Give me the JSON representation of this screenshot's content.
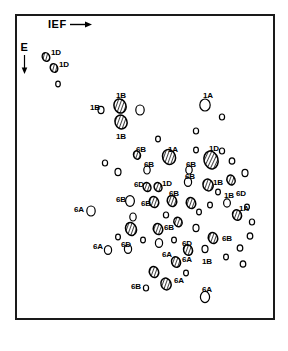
{
  "figure": {
    "background_color": "#ffffff",
    "ink_color": "#000000",
    "frame": {
      "x": 15,
      "y": 14,
      "width": 260,
      "height": 306,
      "border_color": "#1a1a1a",
      "border_width": 2
    }
  },
  "axes": {
    "horizontal": {
      "label": "IEF",
      "arrow": "right-arrow-icon",
      "direction": "right"
    },
    "vertical": {
      "label": "E",
      "arrow": "down-arrow-icon",
      "direction": "down"
    }
  },
  "legend": {
    "filled_style": "hatched",
    "open_style": "outline",
    "note": "Hatched ellipses denote labelled protein spots; open ellipses denote unlabelled spots."
  },
  "chart_data": {
    "type": "scatter",
    "xlabel": "IEF",
    "ylabel": "E",
    "xlim": [
      15,
      275
    ],
    "ylim": [
      14,
      320
    ],
    "grid": false,
    "legend_position": "none",
    "x_direction": "right",
    "y_direction": "down",
    "point_count": 84,
    "labels_present": [
      "1A",
      "1B",
      "1D",
      "6A",
      "6B",
      "6D"
    ],
    "points": [
      {
        "x": 46,
        "y": 57,
        "rx": 3.6,
        "ry": 4.4,
        "rot": -25,
        "fill": "hatched",
        "label": "1D",
        "lx": 51,
        "ly": 49
      },
      {
        "x": 54,
        "y": 68,
        "rx": 3.6,
        "ry": 4.4,
        "rot": -25,
        "fill": "hatched",
        "label": "1D",
        "lx": 59,
        "ly": 61
      },
      {
        "x": 58,
        "y": 84,
        "rx": 2.3,
        "ry": 2.8,
        "rot": 0,
        "fill": "open",
        "label": "",
        "lx": 0,
        "ly": 0
      },
      {
        "x": 101,
        "y": 110,
        "rx": 3.0,
        "ry": 3.6,
        "rot": 0,
        "fill": "open",
        "label": "1B",
        "lx": 90,
        "ly": 104
      },
      {
        "x": 120,
        "y": 106,
        "rx": 6.0,
        "ry": 7.2,
        "rot": -20,
        "fill": "hatched",
        "label": "1B",
        "lx": 116,
        "ly": 92
      },
      {
        "x": 121,
        "y": 122,
        "rx": 6.0,
        "ry": 7.0,
        "rot": -20,
        "fill": "hatched",
        "label": "1B",
        "lx": 116,
        "ly": 133
      },
      {
        "x": 140,
        "y": 110,
        "rx": 4.2,
        "ry": 5.0,
        "rot": 0,
        "fill": "open",
        "label": "",
        "lx": 0,
        "ly": 0
      },
      {
        "x": 205,
        "y": 105,
        "rx": 5.2,
        "ry": 6.0,
        "rot": 0,
        "fill": "open",
        "label": "1A",
        "lx": 203,
        "ly": 92
      },
      {
        "x": 222,
        "y": 117,
        "rx": 2.6,
        "ry": 3.0,
        "rot": 0,
        "fill": "open",
        "label": "",
        "lx": 0,
        "ly": 0
      },
      {
        "x": 196,
        "y": 131,
        "rx": 2.6,
        "ry": 3.0,
        "rot": 0,
        "fill": "open",
        "label": "",
        "lx": 0,
        "ly": 0
      },
      {
        "x": 137,
        "y": 155,
        "rx": 3.4,
        "ry": 4.2,
        "rot": -20,
        "fill": "hatched",
        "label": "6B",
        "lx": 136,
        "ly": 146
      },
      {
        "x": 105,
        "y": 163,
        "rx": 2.6,
        "ry": 3.0,
        "rot": 0,
        "fill": "open",
        "label": "",
        "lx": 0,
        "ly": 0
      },
      {
        "x": 169,
        "y": 157,
        "rx": 6.4,
        "ry": 7.6,
        "rot": -20,
        "fill": "hatched",
        "label": "1A",
        "lx": 168,
        "ly": 146
      },
      {
        "x": 211,
        "y": 160,
        "rx": 7.0,
        "ry": 9.0,
        "rot": -15,
        "fill": "hatched",
        "label": "1D",
        "lx": 209,
        "ly": 145
      },
      {
        "x": 147,
        "y": 170,
        "rx": 3.2,
        "ry": 4.0,
        "rot": 0,
        "fill": "open",
        "label": "6B",
        "lx": 144,
        "ly": 161
      },
      {
        "x": 189,
        "y": 170,
        "rx": 3.2,
        "ry": 4.0,
        "rot": 0,
        "fill": "open",
        "label": "6B",
        "lx": 186,
        "ly": 161
      },
      {
        "x": 232,
        "y": 161,
        "rx": 2.8,
        "ry": 3.2,
        "rot": 0,
        "fill": "open",
        "label": "",
        "lx": 0,
        "ly": 0
      },
      {
        "x": 245,
        "y": 173,
        "rx": 3.0,
        "ry": 3.6,
        "rot": 0,
        "fill": "open",
        "label": "",
        "lx": 0,
        "ly": 0
      },
      {
        "x": 147,
        "y": 187,
        "rx": 3.8,
        "ry": 4.6,
        "rot": -20,
        "fill": "hatched",
        "label": "6D",
        "lx": 134,
        "ly": 181
      },
      {
        "x": 158,
        "y": 187,
        "rx": 3.8,
        "ry": 4.6,
        "rot": -20,
        "fill": "hatched",
        "label": "1D",
        "lx": 162,
        "ly": 180
      },
      {
        "x": 188,
        "y": 182,
        "rx": 3.6,
        "ry": 4.4,
        "rot": 0,
        "fill": "open",
        "label": "6B",
        "lx": 185,
        "ly": 173
      },
      {
        "x": 208,
        "y": 185,
        "rx": 5.0,
        "ry": 6.0,
        "rot": -20,
        "fill": "hatched",
        "label": "1B",
        "lx": 213,
        "ly": 179
      },
      {
        "x": 231,
        "y": 180,
        "rx": 4.0,
        "ry": 5.0,
        "rot": -20,
        "fill": "hatched",
        "label": "6D",
        "lx": 236,
        "ly": 190
      },
      {
        "x": 130,
        "y": 201,
        "rx": 4.4,
        "ry": 5.4,
        "rot": 0,
        "fill": "open",
        "label": "6B",
        "lx": 116,
        "ly": 196
      },
      {
        "x": 154,
        "y": 202,
        "rx": 4.6,
        "ry": 5.6,
        "rot": -20,
        "fill": "hatched",
        "label": "6B",
        "lx": 141,
        "ly": 200
      },
      {
        "x": 172,
        "y": 201,
        "rx": 4.6,
        "ry": 5.6,
        "rot": -20,
        "fill": "hatched",
        "label": "6B",
        "lx": 169,
        "ly": 190
      },
      {
        "x": 191,
        "y": 203,
        "rx": 4.6,
        "ry": 5.6,
        "rot": -20,
        "fill": "hatched",
        "label": "",
        "lx": 0,
        "ly": 0
      },
      {
        "x": 227,
        "y": 203,
        "rx": 3.4,
        "ry": 4.2,
        "rot": 0,
        "fill": "open",
        "label": "1B",
        "lx": 224,
        "ly": 192
      },
      {
        "x": 210,
        "y": 205,
        "rx": 2.4,
        "ry": 2.8,
        "rot": 0,
        "fill": "open",
        "label": "",
        "lx": 0,
        "ly": 0
      },
      {
        "x": 247,
        "y": 207,
        "rx": 2.4,
        "ry": 2.8,
        "rot": 0,
        "fill": "open",
        "label": "",
        "lx": 0,
        "ly": 0
      },
      {
        "x": 91,
        "y": 211,
        "rx": 4.2,
        "ry": 5.0,
        "rot": 0,
        "fill": "open",
        "label": "6A",
        "lx": 74,
        "ly": 206
      },
      {
        "x": 133,
        "y": 217,
        "rx": 3.2,
        "ry": 4.0,
        "rot": 0,
        "fill": "open",
        "label": "",
        "lx": 0,
        "ly": 0
      },
      {
        "x": 131,
        "y": 229,
        "rx": 5.4,
        "ry": 6.6,
        "rot": -20,
        "fill": "hatched",
        "label": "",
        "lx": 0,
        "ly": 0
      },
      {
        "x": 158,
        "y": 229,
        "rx": 4.6,
        "ry": 5.6,
        "rot": -20,
        "fill": "hatched",
        "label": "6B",
        "lx": 164,
        "ly": 224
      },
      {
        "x": 178,
        "y": 222,
        "rx": 4.0,
        "ry": 4.8,
        "rot": -20,
        "fill": "hatched",
        "label": "",
        "lx": 0,
        "ly": 0
      },
      {
        "x": 196,
        "y": 228,
        "rx": 3.0,
        "ry": 3.6,
        "rot": 0,
        "fill": "open",
        "label": "",
        "lx": 0,
        "ly": 0
      },
      {
        "x": 237,
        "y": 215,
        "rx": 4.4,
        "ry": 5.4,
        "rot": -20,
        "fill": "hatched",
        "label": "1A",
        "lx": 239,
        "ly": 205
      },
      {
        "x": 252,
        "y": 222,
        "rx": 2.6,
        "ry": 3.0,
        "rot": 0,
        "fill": "open",
        "label": "",
        "lx": 0,
        "ly": 0
      },
      {
        "x": 250,
        "y": 236,
        "rx": 2.8,
        "ry": 3.2,
        "rot": 0,
        "fill": "open",
        "label": "",
        "lx": 0,
        "ly": 0
      },
      {
        "x": 108,
        "y": 250,
        "rx": 3.6,
        "ry": 4.4,
        "rot": 0,
        "fill": "open",
        "label": "6A",
        "lx": 93,
        "ly": 243
      },
      {
        "x": 128,
        "y": 249,
        "rx": 3.6,
        "ry": 4.4,
        "rot": 0,
        "fill": "open",
        "label": "6D",
        "lx": 121,
        "ly": 241
      },
      {
        "x": 159,
        "y": 243,
        "rx": 3.6,
        "ry": 4.4,
        "rot": 0,
        "fill": "open",
        "label": "6A",
        "lx": 162,
        "ly": 251
      },
      {
        "x": 188,
        "y": 250,
        "rx": 4.4,
        "ry": 5.4,
        "rot": -20,
        "fill": "hatched",
        "label": "6D",
        "lx": 182,
        "ly": 240
      },
      {
        "x": 213,
        "y": 238,
        "rx": 4.6,
        "ry": 5.6,
        "rot": -20,
        "fill": "hatched",
        "label": "6B",
        "lx": 222,
        "ly": 235
      },
      {
        "x": 205,
        "y": 249,
        "rx": 3.0,
        "ry": 3.6,
        "rot": 0,
        "fill": "open",
        "label": "1B",
        "lx": 202,
        "ly": 258
      },
      {
        "x": 240,
        "y": 248,
        "rx": 2.8,
        "ry": 3.2,
        "rot": 0,
        "fill": "open",
        "label": "",
        "lx": 0,
        "ly": 0
      },
      {
        "x": 243,
        "y": 264,
        "rx": 2.8,
        "ry": 3.2,
        "rot": 0,
        "fill": "open",
        "label": "",
        "lx": 0,
        "ly": 0
      },
      {
        "x": 176,
        "y": 262,
        "rx": 4.4,
        "ry": 5.4,
        "rot": -20,
        "fill": "hatched",
        "label": "6A",
        "lx": 182,
        "ly": 256
      },
      {
        "x": 154,
        "y": 272,
        "rx": 4.6,
        "ry": 5.6,
        "rot": -20,
        "fill": "hatched",
        "label": "",
        "lx": 0,
        "ly": 0
      },
      {
        "x": 166,
        "y": 284,
        "rx": 5.0,
        "ry": 6.0,
        "rot": -20,
        "fill": "hatched",
        "label": "6A",
        "lx": 174,
        "ly": 277
      },
      {
        "x": 146,
        "y": 288,
        "rx": 2.6,
        "ry": 3.0,
        "rot": 0,
        "fill": "open",
        "label": "6B",
        "lx": 131,
        "ly": 283
      },
      {
        "x": 205,
        "y": 297,
        "rx": 4.6,
        "ry": 5.6,
        "rot": 0,
        "fill": "open",
        "label": "6A",
        "lx": 202,
        "ly": 286
      },
      {
        "x": 118,
        "y": 172,
        "rx": 3.0,
        "ry": 3.6,
        "rot": 0,
        "fill": "open",
        "label": "",
        "lx": 0,
        "ly": 0
      },
      {
        "x": 166,
        "y": 215,
        "rx": 2.6,
        "ry": 3.0,
        "rot": 0,
        "fill": "open",
        "label": "",
        "lx": 0,
        "ly": 0
      },
      {
        "x": 218,
        "y": 192,
        "rx": 2.4,
        "ry": 2.8,
        "rot": 0,
        "fill": "open",
        "label": "",
        "lx": 0,
        "ly": 0
      },
      {
        "x": 143,
        "y": 240,
        "rx": 2.4,
        "ry": 2.8,
        "rot": 0,
        "fill": "open",
        "label": "",
        "lx": 0,
        "ly": 0
      },
      {
        "x": 118,
        "y": 237,
        "rx": 2.4,
        "ry": 2.8,
        "rot": 0,
        "fill": "open",
        "label": "",
        "lx": 0,
        "ly": 0
      },
      {
        "x": 199,
        "y": 212,
        "rx": 2.4,
        "ry": 2.8,
        "rot": 0,
        "fill": "open",
        "label": "",
        "lx": 0,
        "ly": 0
      },
      {
        "x": 174,
        "y": 240,
        "rx": 2.4,
        "ry": 2.8,
        "rot": 0,
        "fill": "open",
        "label": "",
        "lx": 0,
        "ly": 0
      },
      {
        "x": 226,
        "y": 257,
        "rx": 2.4,
        "ry": 2.8,
        "rot": 0,
        "fill": "open",
        "label": "",
        "lx": 0,
        "ly": 0
      },
      {
        "x": 186,
        "y": 273,
        "rx": 2.4,
        "ry": 2.8,
        "rot": 0,
        "fill": "open",
        "label": "",
        "lx": 0,
        "ly": 0
      },
      {
        "x": 196,
        "y": 150,
        "rx": 2.4,
        "ry": 2.8,
        "rot": 0,
        "fill": "open",
        "label": "",
        "lx": 0,
        "ly": 0
      },
      {
        "x": 222,
        "y": 151,
        "rx": 2.6,
        "ry": 3.0,
        "rot": 0,
        "fill": "open",
        "label": "",
        "lx": 0,
        "ly": 0
      },
      {
        "x": 158,
        "y": 139,
        "rx": 2.4,
        "ry": 2.8,
        "rot": 0,
        "fill": "open",
        "label": "",
        "lx": 0,
        "ly": 0
      }
    ]
  }
}
